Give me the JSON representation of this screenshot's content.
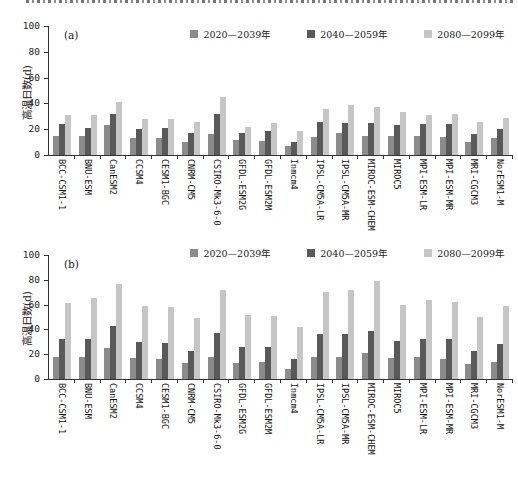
{
  "figure": {
    "cropped_top_caption": "partially-cropped text line (only bottom pixels of glyphs visible)",
    "axis_color": "#333333",
    "text_color": "#222222"
  },
  "chart_data": [
    {
      "type": "bar",
      "panel_label": "(a)",
      "ylabel": "高温日数(d)",
      "ylim": [
        0,
        100
      ],
      "yticks": [
        0,
        20,
        40,
        60,
        80,
        100
      ],
      "grid": false,
      "legend_position": "top-right",
      "categories": [
        "BCC-CSM1-1",
        "BNU-ESM",
        "CanESM2",
        "CCSM4",
        "CESM1-BGC",
        "CNRM-CM5",
        "CSIRO-Mk3-6-0",
        "GFDL-ESM2G",
        "GFDL-ESM2M",
        "Inmcm4",
        "IPSL-CM5A-LR",
        "IPSL-CM5A-MR",
        "MIROC-ESM-CHEM",
        "MIROC5",
        "MPI-ESM-LR",
        "MPI-ESM-MR",
        "MRI-CGCM3",
        "NorESM1-M"
      ],
      "series": [
        {
          "name": "2020—2039年",
          "color": "#8b8b8b",
          "values": [
            15,
            15,
            23,
            13,
            13,
            10,
            16,
            12,
            11,
            7,
            14,
            17,
            15,
            15,
            15,
            14,
            10,
            13
          ]
        },
        {
          "name": "2040—2059年",
          "color": "#595959",
          "values": [
            24,
            21,
            32,
            20,
            21,
            17,
            32,
            17,
            19,
            10,
            26,
            25,
            25,
            23,
            24,
            24,
            16,
            20
          ]
        },
        {
          "name": "2080—2099年",
          "color": "#c6c6c6",
          "values": [
            31,
            31,
            41,
            28,
            28,
            26,
            45,
            22,
            25,
            19,
            36,
            39,
            37,
            33,
            31,
            32,
            26,
            29
          ]
        }
      ]
    },
    {
      "type": "bar",
      "panel_label": "(b)",
      "ylabel": "高温日数(d)",
      "ylim": [
        0,
        100
      ],
      "yticks": [
        0,
        20,
        40,
        60,
        80,
        100
      ],
      "grid": false,
      "legend_position": "top-right",
      "categories": [
        "BCC-CSM1-1",
        "BNU-ESM",
        "CanESM2",
        "CCSM4",
        "CESM1-BGC",
        "CNRM-CM5",
        "CSIRO-Mk3-6-0",
        "GFDL-ESM2G",
        "GFDL-ESM2M",
        "Inmcm4",
        "IPSL-CM5A-LR",
        "IPSL-CM5A-MR",
        "MIROC-ESM-CHEM",
        "MIROC5",
        "MPI-ESM-LR",
        "MPI-ESM-MR",
        "MRI-CGCM3",
        "NorESM1-M"
      ],
      "series": [
        {
          "name": "2020—2039年",
          "color": "#8b8b8b",
          "values": [
            18,
            18,
            25,
            17,
            16,
            13,
            18,
            13,
            14,
            8,
            18,
            18,
            21,
            17,
            18,
            16,
            12,
            14
          ]
        },
        {
          "name": "2040—2059年",
          "color": "#595959",
          "values": [
            32,
            32,
            43,
            30,
            29,
            23,
            37,
            26,
            26,
            16,
            36,
            36,
            39,
            31,
            32,
            32,
            23,
            28
          ]
        },
        {
          "name": "2080—2099年",
          "color": "#c6c6c6",
          "values": [
            61,
            65,
            77,
            59,
            58,
            49,
            72,
            52,
            51,
            42,
            70,
            72,
            79,
            60,
            64,
            62,
            50,
            59
          ]
        }
      ]
    }
  ]
}
